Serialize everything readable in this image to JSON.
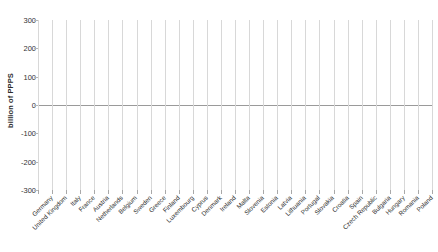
{
  "chart_data": {
    "type": "bar",
    "title": "",
    "subtitle": "",
    "xlabel": "",
    "ylabel": "billion of PPPS",
    "ylim": [
      -300,
      300
    ],
    "yticks": [
      300,
      200,
      100,
      0,
      -100,
      -200,
      -300
    ],
    "ytick_labels": [
      "300",
      "200",
      "100",
      "0",
      "-100",
      "-200",
      "-300"
    ],
    "grid": "vertical-gridlines-only",
    "legend": "none",
    "bar_color": "#4a4a4a",
    "gridline_color": "#d8d8d8",
    "axis_color": "#9a9a9a",
    "categories": [
      "Germany",
      "United Kingdom",
      "Italy",
      "France",
      "Austria",
      "Netherlands",
      "Belgium",
      "Sweden",
      "Greece",
      "Finland",
      "Luxembourg",
      "Cyprus",
      "Denmark",
      "Ireland",
      "Malta",
      "Slovenia",
      "Estonia",
      "Latvia",
      "Lithuania",
      "Portugal",
      "Slovakia",
      "Croatia",
      "Spain",
      "Czech Republic",
      "Bulgaria",
      "Hungary",
      "Romania",
      "Poland"
    ],
    "values": [
      -255,
      -218,
      -127,
      -95,
      -47,
      -30,
      -22,
      -16,
      -13,
      -11,
      -9,
      -7,
      -6,
      -4,
      -2,
      4,
      9,
      14,
      19,
      24,
      30,
      37,
      45,
      55,
      68,
      82,
      170,
      237
    ]
  }
}
